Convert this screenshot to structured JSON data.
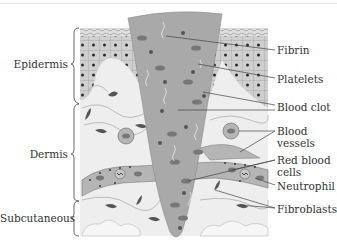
{
  "figure": {
    "layers": [
      {
        "id": "epidermis",
        "label": "Epidermis"
      },
      {
        "id": "dermis",
        "label": "Dermis"
      },
      {
        "id": "subcutaneous",
        "label": "Subcutaneous"
      }
    ],
    "callouts": [
      {
        "id": "fibrin",
        "label": "Fibrin"
      },
      {
        "id": "platelets",
        "label": "Platelets"
      },
      {
        "id": "blood-clot",
        "label": "Blood clot"
      },
      {
        "id": "blood-vessels",
        "label": "Blood vessels",
        "line1": "Blood",
        "line2": "vessels"
      },
      {
        "id": "red-blood-cells",
        "label": "Red blood cells",
        "line1": "Red blood",
        "line2": "cells"
      },
      {
        "id": "neutrophil",
        "label": "Neutrophil"
      },
      {
        "id": "fibroblasts",
        "label": "Fibroblasts"
      }
    ],
    "colors": {
      "clot": "#a9a9a9",
      "epidermis_cells": "#c9c9c9",
      "dermis": "#ececec",
      "vessel": "#b3b3b3",
      "dark_cell": "#6e6e6e",
      "nucleus": "#2a2a2a",
      "leader_line": "#444444"
    }
  }
}
